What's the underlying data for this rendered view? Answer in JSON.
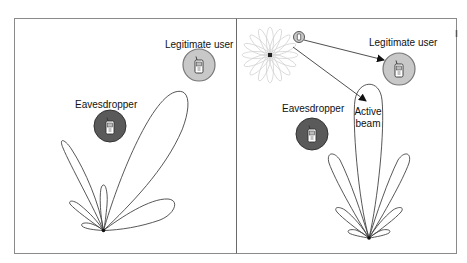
{
  "panels": [
    {
      "id": "left",
      "title": "Passive scenario",
      "legitimate_user": {
        "label": "Legitimate user",
        "fill": "#c8c8c8"
      },
      "eavesdropper": {
        "label": "Eavesdropper",
        "fill": "#5a5a5a"
      }
    },
    {
      "id": "right",
      "legitimate_user": {
        "label": "Legitimate user",
        "fill": "#c8c8c8"
      },
      "eavesdropper": {
        "label": "Eavesdropper",
        "fill": "#5a5a5a"
      },
      "beam_label_line1": "Active",
      "beam_label_line2": "beam"
    }
  ],
  "colors": {
    "border": "#8a8a8a",
    "beam_line": "#444444",
    "flower": "#c8c8c8"
  }
}
